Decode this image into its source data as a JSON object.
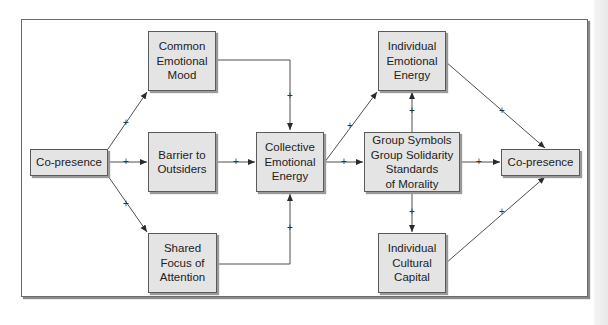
{
  "diagram": {
    "nodes": {
      "copresence_left": {
        "lines": [
          "Co-presence"
        ]
      },
      "common_mood": {
        "lines": [
          "Common",
          "Emotional",
          "Mood"
        ]
      },
      "barrier": {
        "lines": [
          "Barrier to",
          "Outsiders"
        ]
      },
      "shared_focus": {
        "lines": [
          "Shared",
          "Focus of",
          "Attention"
        ]
      },
      "collective_energy": {
        "lines": [
          "Collective",
          "Emotional",
          "Energy"
        ]
      },
      "individual_energy": {
        "lines": [
          "Individual",
          "Emotional",
          "Energy"
        ]
      },
      "group_outcomes": {
        "lines": [
          "Group Symbols",
          "Group Solidarity",
          "Standards",
          "of Morality"
        ]
      },
      "copresence_right": {
        "lines": [
          "Co-presence"
        ]
      },
      "cultural_capital": {
        "lines": [
          "Individual",
          "Cultural",
          "Capital"
        ]
      }
    },
    "edges": [
      {
        "from": "copresence_left",
        "to": "common_mood",
        "sign": "+"
      },
      {
        "from": "copresence_left",
        "to": "barrier",
        "sign": "+"
      },
      {
        "from": "copresence_left",
        "to": "shared_focus",
        "sign": "+"
      },
      {
        "from": "common_mood",
        "to": "collective_energy",
        "sign": "+"
      },
      {
        "from": "barrier",
        "to": "collective_energy",
        "sign": "+"
      },
      {
        "from": "shared_focus",
        "to": "collective_energy",
        "sign": "+"
      },
      {
        "from": "collective_energy",
        "to": "individual_energy",
        "sign": "+"
      },
      {
        "from": "collective_energy",
        "to": "group_outcomes",
        "sign": "+"
      },
      {
        "from": "group_outcomes",
        "to": "individual_energy",
        "sign": "+"
      },
      {
        "from": "group_outcomes",
        "to": "cultural_capital",
        "sign": "+"
      },
      {
        "from": "group_outcomes",
        "to": "copresence_right",
        "sign": "+"
      },
      {
        "from": "individual_energy",
        "to": "copresence_right",
        "sign": "+"
      },
      {
        "from": "cultural_capital",
        "to": "copresence_right",
        "sign": "+"
      }
    ],
    "colors": {
      "node_fill": "#e4e4e4",
      "node_border": "#5a5a5a",
      "line": "#3a3a3a"
    }
  }
}
